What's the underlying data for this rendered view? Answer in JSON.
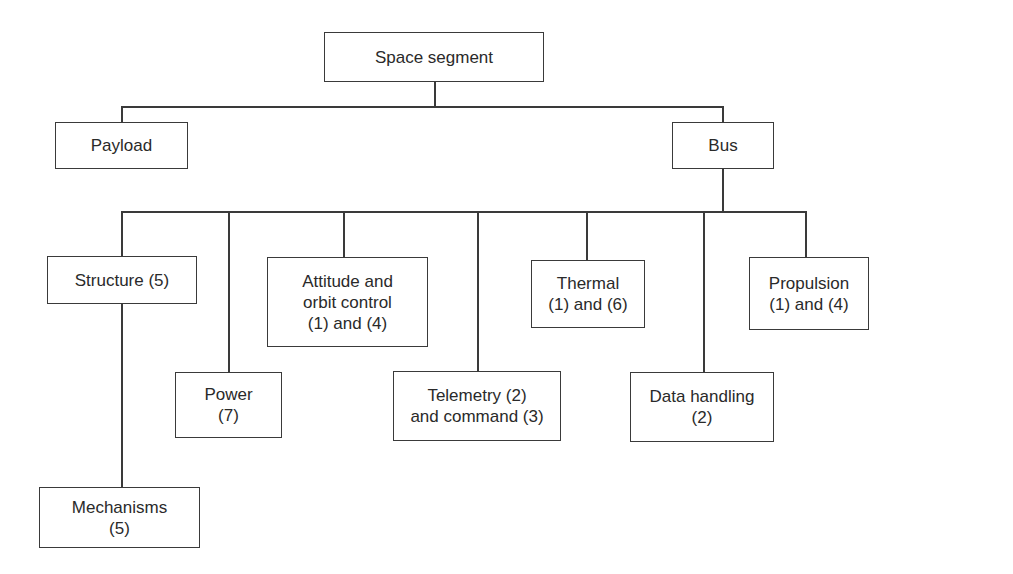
{
  "diagram": {
    "type": "hierarchy-tree",
    "root": {
      "label": "Space segment"
    },
    "level1": [
      {
        "id": "payload",
        "label": "Payload"
      },
      {
        "id": "bus",
        "label": "Bus"
      }
    ],
    "bus_children": [
      {
        "id": "structure",
        "label": "Structure (5)"
      },
      {
        "id": "power",
        "label": "Power\n(7)"
      },
      {
        "id": "attitude",
        "label": "Attitude and\norbit control\n(1) and (4)"
      },
      {
        "id": "telemetry",
        "label": "Telemetry (2)\nand command (3)"
      },
      {
        "id": "thermal",
        "label": "Thermal\n(1) and (6)"
      },
      {
        "id": "data-handling",
        "label": "Data handling\n(2)"
      },
      {
        "id": "propulsion",
        "label": "Propulsion\n(1) and (4)"
      }
    ],
    "structure_children": [
      {
        "id": "mechanisms",
        "label": "Mechanisms\n(5)"
      }
    ]
  }
}
